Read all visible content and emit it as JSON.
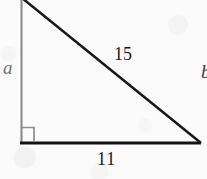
{
  "figure": {
    "kind": "right-triangle-geometry-diagram",
    "background_color": "#fbfbfb",
    "labels": {
      "vertical_leg": "a",
      "hypotenuse": "15",
      "base_leg": "11",
      "cropped_edge_glyph": "b"
    },
    "colors": {
      "stroke_dark": "#141414",
      "stroke_light": "#8a8a8a",
      "label_dark": "#1b1b1b",
      "label_light": "#6f6f6f"
    },
    "geometry": {
      "top_vertex": [
        24,
        0
      ],
      "right_angle_vertex": [
        21,
        143
      ],
      "right_vertex": [
        200,
        143
      ],
      "right_angle_marker": {
        "x": 21,
        "y": 127,
        "size": 13
      }
    }
  }
}
